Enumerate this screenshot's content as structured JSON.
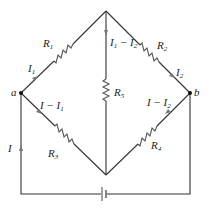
{
  "diagram": {
    "type": "Wheatstone bridge circuit",
    "nodes": {
      "a": {
        "label": "a"
      },
      "b": {
        "label": "b"
      }
    },
    "resistors": [
      {
        "id": "R1",
        "label": "R",
        "sub": "1"
      },
      {
        "id": "R2",
        "label": "R",
        "sub": "2"
      },
      {
        "id": "R3",
        "label": "R",
        "sub": "3"
      },
      {
        "id": "R4",
        "label": "R",
        "sub": "4"
      },
      {
        "id": "R5",
        "label": "R",
        "sub": "5"
      }
    ],
    "currents": [
      {
        "id": "I1",
        "text": "I",
        "sub": "1"
      },
      {
        "id": "I2",
        "text": "I",
        "sub": "2"
      },
      {
        "id": "I1_minus_I2",
        "text_a": "I",
        "sub_a": "1",
        "op": " − ",
        "text_b": "I",
        "sub_b": "2"
      },
      {
        "id": "I_minus_I1",
        "text_a": "I",
        "op": " − ",
        "text_b": "I",
        "sub_b": "1"
      },
      {
        "id": "I_minus_I2",
        "text_a": "I",
        "op": " − ",
        "text_b": "I",
        "sub_b": "2"
      },
      {
        "id": "I",
        "text": "I"
      }
    ],
    "source": {
      "type": "battery"
    },
    "colors": {
      "wire": "#333333",
      "resistor": "#555555",
      "arrow": "#777777",
      "background": "#ffffff"
    }
  }
}
